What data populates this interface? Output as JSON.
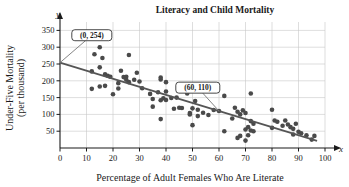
{
  "chart_data": {
    "type": "scatter",
    "title": "Literacy and Child Mortality",
    "xlabel": "Percentage of Adult Females Who Are Literate",
    "ylabel_line1": "Under-Five Mortality",
    "ylabel_line2": "(per thousand)",
    "x_axis_symbol": "x",
    "y_axis_symbol": "y",
    "xlim": [
      0,
      100
    ],
    "ylim": [
      0,
      375
    ],
    "xticks": [
      0,
      10,
      20,
      30,
      40,
      50,
      60,
      70,
      80,
      90,
      100
    ],
    "yticks": [
      50,
      100,
      150,
      200,
      250,
      300,
      350
    ],
    "grid": true,
    "legend": "none",
    "point_color": "#4a4a4a",
    "line_color": "#555555",
    "grid_color": "#c8c8c8",
    "trend_line": {
      "label": "least-squares regression line",
      "intercept": 254,
      "slope": -2.4,
      "x_start": 0,
      "y_start": 254,
      "x_end": 97,
      "y_end": 21
    },
    "annotations": [
      {
        "label": "(0, 254)",
        "point_x": 0,
        "point_y": 254,
        "box_x": 12,
        "box_y": 352
      },
      {
        "label": "(60, 110)",
        "point_x": 60,
        "point_y": 110,
        "box_x": 52,
        "box_y": 196
      }
    ],
    "points": [
      [
        12,
        228
      ],
      [
        12,
        176
      ],
      [
        13,
        279
      ],
      [
        15,
        300
      ],
      [
        15,
        240
      ],
      [
        15,
        183
      ],
      [
        16,
        268
      ],
      [
        17,
        219
      ],
      [
        17,
        185
      ],
      [
        18,
        215
      ],
      [
        19,
        212
      ],
      [
        20,
        160
      ],
      [
        22,
        193
      ],
      [
        22,
        177
      ],
      [
        23,
        230
      ],
      [
        24,
        211
      ],
      [
        25,
        212
      ],
      [
        25,
        203
      ],
      [
        26,
        277
      ],
      [
        26,
        196
      ],
      [
        28,
        203
      ],
      [
        29,
        224
      ],
      [
        30,
        198
      ],
      [
        31,
        178
      ],
      [
        34,
        161
      ],
      [
        35,
        146
      ],
      [
        35,
        123
      ],
      [
        37,
        166
      ],
      [
        38,
        210
      ],
      [
        38,
        204
      ],
      [
        38,
        142
      ],
      [
        38,
        86
      ],
      [
        39,
        148
      ],
      [
        40,
        196
      ],
      [
        40,
        168
      ],
      [
        40,
        143
      ],
      [
        42,
        149
      ],
      [
        43,
        117
      ],
      [
        44,
        150
      ],
      [
        45,
        120
      ],
      [
        46,
        119
      ],
      [
        48,
        162
      ],
      [
        49,
        104
      ],
      [
        49,
        100
      ],
      [
        50,
        118
      ],
      [
        50,
        68
      ],
      [
        51,
        140
      ],
      [
        52,
        114
      ],
      [
        52,
        95
      ],
      [
        54,
        105
      ],
      [
        56,
        98
      ],
      [
        58,
        113
      ],
      [
        60,
        110
      ],
      [
        62,
        155
      ],
      [
        62,
        50
      ],
      [
        65,
        88
      ],
      [
        66,
        120
      ],
      [
        67,
        108
      ],
      [
        67,
        30
      ],
      [
        68,
        100
      ],
      [
        68,
        36
      ],
      [
        69,
        112
      ],
      [
        70,
        104
      ],
      [
        70,
        55
      ],
      [
        70,
        22
      ],
      [
        71,
        62
      ],
      [
        71,
        38
      ],
      [
        72,
        162
      ],
      [
        72,
        80
      ],
      [
        72,
        52
      ],
      [
        73,
        72
      ],
      [
        73,
        50
      ],
      [
        80,
        114
      ],
      [
        80,
        60
      ],
      [
        81,
        82
      ],
      [
        82,
        78
      ],
      [
        84,
        66
      ],
      [
        85,
        82
      ],
      [
        86,
        70
      ],
      [
        87,
        62
      ],
      [
        88,
        57
      ],
      [
        88,
        40
      ],
      [
        89,
        72
      ],
      [
        90,
        48
      ],
      [
        91,
        44
      ],
      [
        93,
        38
      ],
      [
        95,
        25
      ],
      [
        96,
        36
      ]
    ]
  }
}
